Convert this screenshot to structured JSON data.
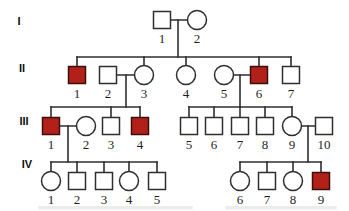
{
  "diagram": {
    "type": "pedigree-chart",
    "colors": {
      "background": "#ffffff",
      "line": "#2e2e2e",
      "symbol_stroke": "#2e2e2e",
      "affected_fill": "#b2201a",
      "affected_stroke": "#3c0f0d",
      "unaffected_fill": "#ffffff",
      "number_text": "#1f1f1f"
    },
    "symbol": {
      "square_size": 17,
      "circle_radius": 9.5,
      "stroke_width": 1.5,
      "line_width": 1.6
    },
    "generation_labels": [
      {
        "label": "I",
        "x": 19,
        "y": 25
      },
      {
        "label": "II",
        "x": 22,
        "y": 72
      },
      {
        "label": "III",
        "x": 24,
        "y": 125
      },
      {
        "label": "IV",
        "x": 27,
        "y": 168
      }
    ],
    "individuals": [
      {
        "id": "I-1",
        "generation": "I",
        "number": "1",
        "sex": "male",
        "affected": false,
        "x": 162,
        "y": 20
      },
      {
        "id": "I-2",
        "generation": "I",
        "number": "2",
        "sex": "female",
        "affected": false,
        "x": 197,
        "y": 20
      },
      {
        "id": "II-1",
        "generation": "II",
        "number": "1",
        "sex": "male",
        "affected": true,
        "x": 77,
        "y": 75
      },
      {
        "id": "II-2",
        "generation": "II",
        "number": "2",
        "sex": "male",
        "affected": false,
        "x": 108,
        "y": 75
      },
      {
        "id": "II-3",
        "generation": "II",
        "number": "3",
        "sex": "female",
        "affected": false,
        "x": 144,
        "y": 75
      },
      {
        "id": "II-4",
        "generation": "II",
        "number": "4",
        "sex": "female",
        "affected": false,
        "x": 186,
        "y": 75
      },
      {
        "id": "II-5",
        "generation": "II",
        "number": "5",
        "sex": "female",
        "affected": false,
        "x": 224,
        "y": 75
      },
      {
        "id": "II-6",
        "generation": "II",
        "number": "6",
        "sex": "male",
        "affected": true,
        "x": 259,
        "y": 75
      },
      {
        "id": "II-7",
        "generation": "II",
        "number": "7",
        "sex": "male",
        "affected": false,
        "x": 291,
        "y": 75
      },
      {
        "id": "III-1",
        "generation": "III",
        "number": "1",
        "sex": "male",
        "affected": true,
        "x": 51,
        "y": 126
      },
      {
        "id": "III-2",
        "generation": "III",
        "number": "2",
        "sex": "female",
        "affected": false,
        "x": 86,
        "y": 126
      },
      {
        "id": "III-3",
        "generation": "III",
        "number": "3",
        "sex": "male",
        "affected": false,
        "x": 111,
        "y": 126
      },
      {
        "id": "III-4",
        "generation": "III",
        "number": "4",
        "sex": "male",
        "affected": true,
        "x": 140,
        "y": 126
      },
      {
        "id": "III-5",
        "generation": "III",
        "number": "5",
        "sex": "male",
        "affected": false,
        "x": 189,
        "y": 126
      },
      {
        "id": "III-6",
        "generation": "III",
        "number": "6",
        "sex": "male",
        "affected": false,
        "x": 214,
        "y": 126
      },
      {
        "id": "III-7",
        "generation": "III",
        "number": "7",
        "sex": "male",
        "affected": false,
        "x": 240,
        "y": 126
      },
      {
        "id": "III-8",
        "generation": "III",
        "number": "8",
        "sex": "male",
        "affected": false,
        "x": 265,
        "y": 126
      },
      {
        "id": "III-9",
        "generation": "III",
        "number": "9",
        "sex": "female",
        "affected": false,
        "x": 292,
        "y": 126
      },
      {
        "id": "III-10",
        "generation": "III",
        "number": "10",
        "sex": "male",
        "affected": false,
        "x": 324,
        "y": 126
      },
      {
        "id": "IV-1",
        "generation": "IV",
        "number": "1",
        "sex": "female",
        "affected": false,
        "x": 51,
        "y": 181
      },
      {
        "id": "IV-2",
        "generation": "IV",
        "number": "2",
        "sex": "male",
        "affected": false,
        "x": 77,
        "y": 181
      },
      {
        "id": "IV-3",
        "generation": "IV",
        "number": "3",
        "sex": "male",
        "affected": false,
        "x": 104,
        "y": 181
      },
      {
        "id": "IV-4",
        "generation": "IV",
        "number": "4",
        "sex": "female",
        "affected": false,
        "x": 129,
        "y": 181
      },
      {
        "id": "IV-5",
        "generation": "IV",
        "number": "5",
        "sex": "male",
        "affected": false,
        "x": 157,
        "y": 181
      },
      {
        "id": "IV-6",
        "generation": "IV",
        "number": "6",
        "sex": "female",
        "affected": false,
        "x": 240,
        "y": 181
      },
      {
        "id": "IV-7",
        "generation": "IV",
        "number": "7",
        "sex": "male",
        "affected": false,
        "x": 267,
        "y": 181
      },
      {
        "id": "IV-8",
        "generation": "IV",
        "number": "8",
        "sex": "female",
        "affected": false,
        "x": 293,
        "y": 181
      },
      {
        "id": "IV-9",
        "generation": "IV",
        "number": "9",
        "sex": "male",
        "affected": true,
        "x": 321,
        "y": 181
      }
    ],
    "connections": [
      {
        "name": "marriage-I1-I2",
        "x1": 162,
        "y1": 20,
        "x2": 197,
        "y2": 20
      },
      {
        "name": "descent-I-couple",
        "x1": 178,
        "y1": 20,
        "x2": 178,
        "y2": 57
      },
      {
        "name": "sibship-II",
        "x1": 77,
        "y1": 57,
        "x2": 291,
        "y2": 57
      },
      {
        "name": "drop-II-1",
        "x1": 77,
        "y1": 57,
        "x2": 77,
        "y2": 75
      },
      {
        "name": "drop-II-3",
        "x1": 144,
        "y1": 57,
        "x2": 144,
        "y2": 75
      },
      {
        "name": "drop-II-4",
        "x1": 186,
        "y1": 57,
        "x2": 186,
        "y2": 75
      },
      {
        "name": "drop-II-6",
        "x1": 259,
        "y1": 57,
        "x2": 259,
        "y2": 75
      },
      {
        "name": "drop-II-7",
        "x1": 291,
        "y1": 57,
        "x2": 291,
        "y2": 75
      },
      {
        "name": "marriage-II2-II3",
        "x1": 108,
        "y1": 75,
        "x2": 144,
        "y2": 75
      },
      {
        "name": "descent-II2-II3",
        "x1": 126,
        "y1": 75,
        "x2": 126,
        "y2": 107
      },
      {
        "name": "marriage-II5-II6",
        "x1": 224,
        "y1": 75,
        "x2": 259,
        "y2": 75
      },
      {
        "name": "descent-II5-II6",
        "x1": 240,
        "y1": 75,
        "x2": 240,
        "y2": 107
      },
      {
        "name": "sibship-III-left",
        "x1": 51,
        "y1": 107,
        "x2": 140,
        "y2": 107
      },
      {
        "name": "drop-III-1",
        "x1": 51,
        "y1": 107,
        "x2": 51,
        "y2": 126
      },
      {
        "name": "drop-III-3",
        "x1": 111,
        "y1": 107,
        "x2": 111,
        "y2": 126
      },
      {
        "name": "drop-III-4",
        "x1": 140,
        "y1": 107,
        "x2": 140,
        "y2": 126
      },
      {
        "name": "sibship-III-right",
        "x1": 189,
        "y1": 107,
        "x2": 292,
        "y2": 107
      },
      {
        "name": "drop-III-5",
        "x1": 189,
        "y1": 107,
        "x2": 189,
        "y2": 126
      },
      {
        "name": "drop-III-6",
        "x1": 214,
        "y1": 107,
        "x2": 214,
        "y2": 126
      },
      {
        "name": "drop-III-7",
        "x1": 240,
        "y1": 107,
        "x2": 240,
        "y2": 126
      },
      {
        "name": "drop-III-8",
        "x1": 265,
        "y1": 107,
        "x2": 265,
        "y2": 126
      },
      {
        "name": "drop-III-9",
        "x1": 292,
        "y1": 107,
        "x2": 292,
        "y2": 126
      },
      {
        "name": "marriage-III1-III2",
        "x1": 51,
        "y1": 126,
        "x2": 86,
        "y2": 126
      },
      {
        "name": "descent-III1-III2",
        "x1": 68,
        "y1": 126,
        "x2": 68,
        "y2": 162
      },
      {
        "name": "marriage-III9-III10",
        "x1": 292,
        "y1": 126,
        "x2": 324,
        "y2": 126
      },
      {
        "name": "descent-III9-III10",
        "x1": 308,
        "y1": 126,
        "x2": 308,
        "y2": 162
      },
      {
        "name": "sibship-IV-left",
        "x1": 51,
        "y1": 162,
        "x2": 157,
        "y2": 162
      },
      {
        "name": "drop-IV-1",
        "x1": 51,
        "y1": 162,
        "x2": 51,
        "y2": 181
      },
      {
        "name": "drop-IV-2",
        "x1": 77,
        "y1": 162,
        "x2": 77,
        "y2": 181
      },
      {
        "name": "drop-IV-3",
        "x1": 104,
        "y1": 162,
        "x2": 104,
        "y2": 181
      },
      {
        "name": "drop-IV-4",
        "x1": 129,
        "y1": 162,
        "x2": 129,
        "y2": 181
      },
      {
        "name": "drop-IV-5",
        "x1": 157,
        "y1": 162,
        "x2": 157,
        "y2": 181
      },
      {
        "name": "sibship-IV-right",
        "x1": 240,
        "y1": 162,
        "x2": 321,
        "y2": 162
      },
      {
        "name": "drop-IV-6",
        "x1": 240,
        "y1": 162,
        "x2": 240,
        "y2": 181
      },
      {
        "name": "drop-IV-7",
        "x1": 267,
        "y1": 162,
        "x2": 267,
        "y2": 181
      },
      {
        "name": "drop-IV-8",
        "x1": 293,
        "y1": 162,
        "x2": 293,
        "y2": 181
      },
      {
        "name": "drop-IV-9",
        "x1": 321,
        "y1": 162,
        "x2": 321,
        "y2": 181
      }
    ]
  }
}
